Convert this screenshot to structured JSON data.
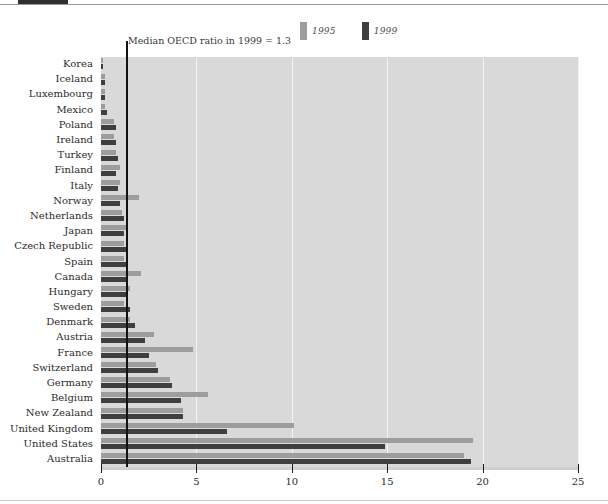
{
  "chart_data": {
    "type": "bar",
    "orientation": "horizontal",
    "title": "",
    "subtitle": "",
    "xlabel": "",
    "ylabel": "",
    "xlim": [
      0,
      25
    ],
    "xticks": [
      0,
      5,
      10,
      15,
      20,
      25
    ],
    "xtick_labels": [
      "0",
      "5",
      "10",
      "15",
      "20",
      "25"
    ],
    "grid": true,
    "grid_axis": "x",
    "legend": {
      "position": "top-center",
      "entries": [
        {
          "name": "1995",
          "color": "#9d9d9d"
        },
        {
          "name": "1999",
          "color": "#3f3f3f"
        }
      ]
    },
    "annotations": [
      {
        "text": "Median OECD ratio in 1999 = 1.3",
        "value": 1.3,
        "type": "vline",
        "color": "#121212"
      }
    ],
    "categories": [
      "Korea",
      "Iceland",
      "Luxembourg",
      "Mexico",
      "Poland",
      "Ireland",
      "Turkey",
      "Finland",
      "Italy",
      "Norway",
      "Netherlands",
      "Japan",
      "Czech Republic",
      "Spain",
      "Canada",
      "Hungary",
      "Sweden",
      "Denmark",
      "Austria",
      "France",
      "Switzerland",
      "Germany",
      "Belgium",
      "New Zealand",
      "United Kingdom",
      "United States",
      "Australia"
    ],
    "series": [
      {
        "name": "1995",
        "color": "#9d9d9d",
        "values": [
          0.1,
          0.2,
          0.2,
          0.2,
          0.7,
          0.7,
          0.8,
          1.0,
          1.0,
          2.0,
          1.1,
          1.4,
          1.2,
          1.2,
          2.1,
          1.5,
          1.2,
          1.5,
          2.8,
          4.8,
          2.9,
          3.6,
          5.6,
          4.3,
          10.1,
          19.5,
          19.0
        ]
      },
      {
        "name": "1999",
        "color": "#3f3f3f",
        "values": [
          0.1,
          0.2,
          0.2,
          0.3,
          0.8,
          0.8,
          0.9,
          0.8,
          0.9,
          1.0,
          1.2,
          1.2,
          1.3,
          1.3,
          1.3,
          1.4,
          1.5,
          1.8,
          2.3,
          2.5,
          3.0,
          3.7,
          4.2,
          4.3,
          6.6,
          14.9,
          19.4
        ]
      }
    ]
  },
  "page": {
    "tab_marker": "",
    "annotation_text": "Median OECD ratio in 1999 = 1.3"
  },
  "legend": {
    "item_1995": "1995",
    "item_1999": "1999"
  },
  "colors": {
    "plot_background": "#d9d9d9",
    "gridline": "#f4f4f4",
    "bar_1995": "#9d9d9d",
    "bar_1999": "#3f3f3f",
    "median_line": "#121212",
    "axis": "#cfcfcf"
  }
}
